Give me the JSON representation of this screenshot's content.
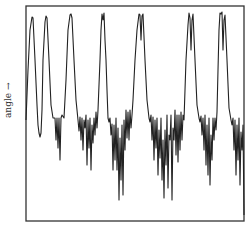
{
  "chart_data": {
    "type": "line",
    "title": "",
    "xlabel": "",
    "ylabel": "angle →",
    "grid": false,
    "legend": null,
    "frame": {
      "x0": 26,
      "y0": 6,
      "x1": 244,
      "y1": 221
    },
    "line_color": "#222222",
    "series": [
      {
        "name": "angle",
        "points": [
          [
            26,
            120
          ],
          [
            28,
            70
          ],
          [
            30,
            30
          ],
          [
            32,
            17
          ],
          [
            33,
            18
          ],
          [
            35,
            60
          ],
          [
            37,
            105
          ],
          [
            38,
            125
          ],
          [
            39,
            133
          ],
          [
            40,
            137
          ],
          [
            41,
            133
          ],
          [
            42,
            110
          ],
          [
            43,
            60
          ],
          [
            45,
            22
          ],
          [
            46,
            16
          ],
          [
            47,
            18
          ],
          [
            49,
            60
          ],
          [
            51,
            105
          ],
          [
            53,
            118
          ],
          [
            55,
            118
          ],
          [
            56,
            140
          ],
          [
            57,
            118
          ],
          [
            58,
            148
          ],
          [
            59,
            118
          ],
          [
            60,
            160
          ],
          [
            61,
            118
          ],
          [
            62,
            115
          ],
          [
            64,
            118
          ],
          [
            66,
            80
          ],
          [
            68,
            30
          ],
          [
            70,
            15
          ],
          [
            71,
            14
          ],
          [
            72,
            18
          ],
          [
            74,
            60
          ],
          [
            76,
            100
          ],
          [
            78,
            120
          ],
          [
            79,
            131
          ],
          [
            80,
            117
          ],
          [
            81,
            140
          ],
          [
            82,
            118
          ],
          [
            83,
            150
          ],
          [
            84,
            120
          ],
          [
            85,
            128
          ],
          [
            86,
            115
          ],
          [
            87,
            165
          ],
          [
            88,
            120
          ],
          [
            89,
            148
          ],
          [
            90,
            118
          ],
          [
            91,
            170
          ],
          [
            92,
            125
          ],
          [
            93,
            143
          ],
          [
            94,
            118
          ],
          [
            95,
            135
          ],
          [
            96,
            112
          ],
          [
            97,
            128
          ],
          [
            98,
            110
          ],
          [
            100,
            60
          ],
          [
            101,
            30
          ],
          [
            102,
            14
          ],
          [
            103,
            20
          ],
          [
            104,
            13
          ],
          [
            105,
            40
          ],
          [
            106,
            60
          ],
          [
            107,
            90
          ],
          [
            108,
            118
          ],
          [
            109,
            122
          ],
          [
            110,
            118
          ],
          [
            111,
            135
          ],
          [
            112,
            124
          ],
          [
            113,
            170
          ],
          [
            114,
            125
          ],
          [
            115,
            160
          ],
          [
            116,
            118
          ],
          [
            117,
            170
          ],
          [
            118,
            128
          ],
          [
            119,
            200
          ],
          [
            120,
            138
          ],
          [
            121,
            180
          ],
          [
            122,
            125
          ],
          [
            123,
            195
          ],
          [
            124,
            120
          ],
          [
            125,
            150
          ],
          [
            126,
            110
          ],
          [
            127,
            138
          ],
          [
            128,
            112
          ],
          [
            129,
            140
          ],
          [
            130,
            110
          ],
          [
            131,
            128
          ],
          [
            132,
            115
          ],
          [
            133,
            100
          ],
          [
            135,
            60
          ],
          [
            137,
            30
          ],
          [
            139,
            14
          ],
          [
            140,
            15
          ],
          [
            141,
            40
          ],
          [
            142,
            16
          ],
          [
            143,
            14
          ],
          [
            145,
            60
          ],
          [
            147,
            100
          ],
          [
            149,
            118
          ],
          [
            150,
            122
          ],
          [
            151,
            115
          ],
          [
            152,
            140
          ],
          [
            153,
            117
          ],
          [
            154,
            160
          ],
          [
            155,
            120
          ],
          [
            156,
            148
          ],
          [
            157,
            118
          ],
          [
            158,
            175
          ],
          [
            159,
            130
          ],
          [
            160,
            158
          ],
          [
            161,
            118
          ],
          [
            162,
            180
          ],
          [
            163,
            140
          ],
          [
            164,
            198
          ],
          [
            165,
            130
          ],
          [
            166,
            165
          ],
          [
            167,
            115
          ],
          [
            168,
            188
          ],
          [
            169,
            135
          ],
          [
            170,
            140
          ],
          [
            171,
            115
          ],
          [
            172,
            200
          ],
          [
            173,
            128
          ],
          [
            174,
            140
          ],
          [
            175,
            110
          ],
          [
            176,
            155
          ],
          [
            177,
            115
          ],
          [
            178,
            162
          ],
          [
            179,
            115
          ],
          [
            180,
            150
          ],
          [
            181,
            112
          ],
          [
            182,
            140
          ],
          [
            183,
            115
          ],
          [
            184,
            120
          ],
          [
            186,
            60
          ],
          [
            188,
            25
          ],
          [
            189,
            13
          ],
          [
            190,
            18
          ],
          [
            191,
            50
          ],
          [
            192,
            20
          ],
          [
            193,
            14
          ],
          [
            195,
            60
          ],
          [
            197,
            105
          ],
          [
            199,
            118
          ],
          [
            200,
            122
          ],
          [
            201,
            116
          ],
          [
            202,
            135
          ],
          [
            203,
            118
          ],
          [
            204,
            150
          ],
          [
            205,
            115
          ],
          [
            206,
            165
          ],
          [
            207,
            125
          ],
          [
            208,
            175
          ],
          [
            209,
            118
          ],
          [
            210,
            185
          ],
          [
            211,
            135
          ],
          [
            212,
            160
          ],
          [
            213,
            118
          ],
          [
            214,
            140
          ],
          [
            215,
            118
          ],
          [
            216,
            130
          ],
          [
            217,
            112
          ],
          [
            218,
            70
          ],
          [
            219,
            30
          ],
          [
            220,
            13
          ],
          [
            221,
            14
          ],
          [
            222,
            12
          ],
          [
            223,
            50
          ],
          [
            224,
            20
          ],
          [
            225,
            15
          ],
          [
            227,
            60
          ],
          [
            229,
            108
          ],
          [
            231,
            120
          ],
          [
            232,
            125
          ],
          [
            233,
            118
          ],
          [
            234,
            150
          ],
          [
            235,
            120
          ],
          [
            236,
            175
          ],
          [
            237,
            125
          ],
          [
            238,
            160
          ],
          [
            239,
            118
          ],
          [
            240,
            185
          ],
          [
            241,
            132
          ],
          [
            242,
            150
          ],
          [
            243,
            125
          ],
          [
            244,
            215
          ]
        ]
      }
    ]
  }
}
